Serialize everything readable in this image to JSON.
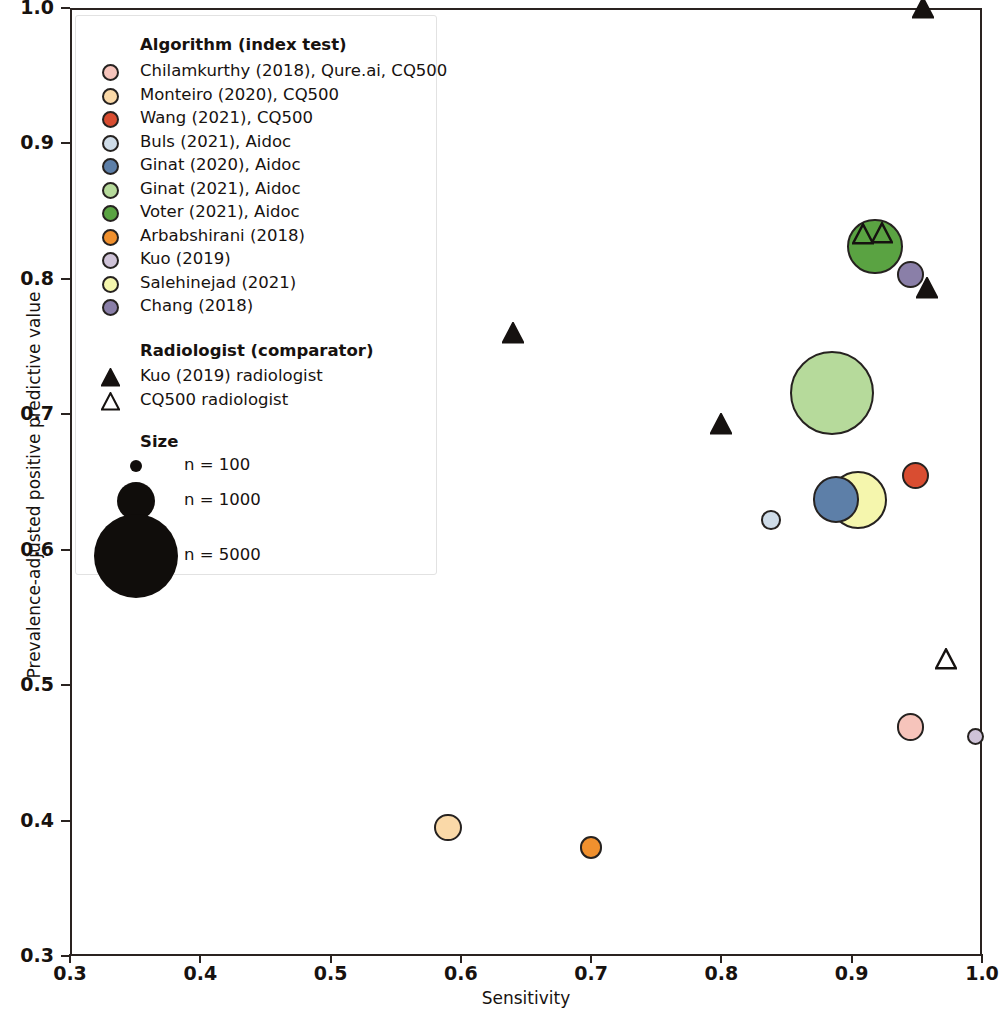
{
  "chart_data": {
    "type": "scatter",
    "title": "",
    "xlabel": "Sensitivity",
    "ylabel": "Prevalence-adjusted positive predictive value",
    "xlim": [
      0.3,
      1.0
    ],
    "ylim": [
      0.3,
      1.0
    ],
    "xticks": [
      "0.3",
      "0.4",
      "0.5",
      "0.6",
      "0.7",
      "0.8",
      "0.9",
      "1.0"
    ],
    "xtick_values": [
      0.3,
      0.4,
      0.5,
      0.6,
      0.7,
      0.8,
      0.9,
      1.0
    ],
    "yticks": [
      "0.3",
      "0.4",
      "0.5",
      "0.6",
      "0.7",
      "0.8",
      "0.9",
      "1.0"
    ],
    "ytick_values": [
      0.3,
      0.4,
      0.5,
      0.6,
      0.7,
      0.8,
      0.9,
      1.0
    ],
    "grid": false,
    "legend_position": "upper-left",
    "size_encoding": "bubble area proportional to sample size n",
    "series": [
      {
        "name": "Chilamkurthy (2018), Qure.ai, CQ500",
        "marker": "circle",
        "color": "#f6c4bb",
        "points": [
          {
            "x": 0.945,
            "y": 0.469,
            "n": 490
          }
        ]
      },
      {
        "name": "Monteiro (2020), CQ500",
        "marker": "circle",
        "color": "#fad9a8",
        "points": [
          {
            "x": 0.59,
            "y": 0.395,
            "n": 490
          }
        ]
      },
      {
        "name": "Wang (2021), CQ500",
        "marker": "circle",
        "color": "#d94d31",
        "points": [
          {
            "x": 0.949,
            "y": 0.655,
            "n": 490
          }
        ]
      },
      {
        "name": "Buls (2021), Aidoc",
        "marker": "circle",
        "color": "#cfdce8",
        "points": [
          {
            "x": 0.838,
            "y": 0.622,
            "n": 250
          }
        ]
      },
      {
        "name": "Ginat (2020), Aidoc",
        "marker": "circle",
        "color": "#5d7fa8",
        "points": [
          {
            "x": 0.888,
            "y": 0.637,
            "n": 1400
          }
        ]
      },
      {
        "name": "Ginat (2021), Aidoc",
        "marker": "circle",
        "color": "#b6da9b",
        "points": [
          {
            "x": 0.885,
            "y": 0.716,
            "n": 4600
          }
        ]
      },
      {
        "name": "Voter (2021), Aidoc",
        "marker": "circle",
        "color": "#5aa342",
        "points": [
          {
            "x": 0.918,
            "y": 0.824,
            "n": 2000
          }
        ]
      },
      {
        "name": "Arbabshirani (2018)",
        "marker": "circle",
        "color": "#f0902e",
        "points": [
          {
            "x": 0.7,
            "y": 0.38,
            "n": 330
          }
        ]
      },
      {
        "name": "Kuo (2019)",
        "marker": "circle",
        "color": "#cfc3d8",
        "points": [
          {
            "x": 0.995,
            "y": 0.462,
            "n": 190
          }
        ]
      },
      {
        "name": "Salehinejad (2021)",
        "marker": "circle",
        "color": "#f5f6ad",
        "points": [
          {
            "x": 0.905,
            "y": 0.637,
            "n": 2200
          }
        ]
      },
      {
        "name": "Chang (2018)",
        "marker": "circle",
        "color": "#8a7fa8",
        "points": [
          {
            "x": 0.945,
            "y": 0.803,
            "n": 460
          }
        ]
      },
      {
        "name": "Kuo (2019) radiologist",
        "marker": "filled-triangle",
        "color": "#161210",
        "points": [
          {
            "x": 0.955,
            "y": 1.0
          },
          {
            "x": 0.958,
            "y": 0.793
          },
          {
            "x": 0.64,
            "y": 0.76
          },
          {
            "x": 0.8,
            "y": 0.693
          }
        ]
      },
      {
        "name": "CQ500 radiologist",
        "marker": "open-triangle",
        "color": "#161210",
        "points": [
          {
            "x": 0.909,
            "y": 0.833
          },
          {
            "x": 0.923,
            "y": 0.834
          },
          {
            "x": 0.972,
            "y": 0.519
          }
        ]
      }
    ]
  },
  "legend": {
    "algorithm_title": "Algorithm (index test)",
    "algorithm_items": [
      {
        "label": "Chilamkurthy (2018), Qure.ai, CQ500",
        "color": "#f6c4bb"
      },
      {
        "label": "Monteiro (2020), CQ500",
        "color": "#fad9a8"
      },
      {
        "label": "Wang (2021), CQ500",
        "color": "#d94d31"
      },
      {
        "label": "Buls (2021), Aidoc",
        "color": "#cfdce8"
      },
      {
        "label": "Ginat (2020), Aidoc",
        "color": "#5d7fa8"
      },
      {
        "label": "Ginat (2021), Aidoc",
        "color": "#b6da9b"
      },
      {
        "label": "Voter (2021), Aidoc",
        "color": "#5aa342"
      },
      {
        "label": "Arbabshirani (2018)",
        "color": "#f0902e"
      },
      {
        "label": "Kuo (2019)",
        "color": "#cfc3d8"
      },
      {
        "label": "Salehinejad (2021)",
        "color": "#f5f6ad"
      },
      {
        "label": "Chang (2018)",
        "color": "#8a7fa8"
      }
    ],
    "radiologist_title": "Radiologist (comparator)",
    "radiologist_items": [
      {
        "label": "Kuo (2019) radiologist",
        "marker": "filled-triangle"
      },
      {
        "label": "CQ500 radiologist",
        "marker": "open-triangle"
      }
    ],
    "size_title": "Size",
    "size_items": [
      {
        "label": "n = 100",
        "n": 100,
        "radius": 6
      },
      {
        "label": "n = 1000",
        "n": 1000,
        "radius": 19
      },
      {
        "label": "n = 5000",
        "n": 5000,
        "radius": 42
      }
    ]
  },
  "colors": {
    "axis": "#2a2320",
    "marker_outline": "#262220",
    "legend_border": "#e2e2e2",
    "background": "#ffffff"
  }
}
